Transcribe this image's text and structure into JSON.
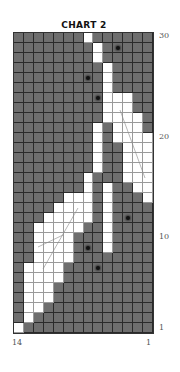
{
  "title": "CHART 2",
  "legend_note": "grid rows listed top (row 30) to bottom (row 1); columns left (14) to right (1); '.' = dark stitch, 'W' = light stitch, 'o' = dark stitch with bead/dot",
  "colors": {
    "dark": "#6e6e6e",
    "light": "#ffffff",
    "dot": "#111111"
  },
  "row_labels": [
    {
      "row": 30,
      "label": "30"
    },
    {
      "row": 20,
      "label": "20"
    },
    {
      "row": 10,
      "label": "10"
    },
    {
      "row": 1,
      "label": "1"
    }
  ],
  "col_labels": [
    {
      "col": 14,
      "label": "14"
    },
    {
      "col": 1,
      "label": "1"
    }
  ],
  "grid": [
    ".......W......",
    "........W.o...",
    "........W.....",
    ".........W....",
    ".......o.W....",
    ".........W....",
    "........oWWW..",
    ".........WWW..",
    ".........WWWW.",
    "........W.WWW.",
    "........W.WWWW",
    "........W..WWW",
    "........W..WWW",
    "........W..WWW",
    ".......W...WWW",
    ".......W.W..WW",
    ".....WWW.W...W",
    "....WWWW.W....",
    "...WWWWW.W.o..",
    "..WWWWW..W....",
    "..WWWW...W....",
    "..WWWW.o.W....",
    "..WWWW........",
    ".WWWW...o.....",
    ".WWWW.........",
    ".WWW..........",
    ".WWW..........",
    ".WW...........",
    ".W............",
    "W............."
  ]
}
